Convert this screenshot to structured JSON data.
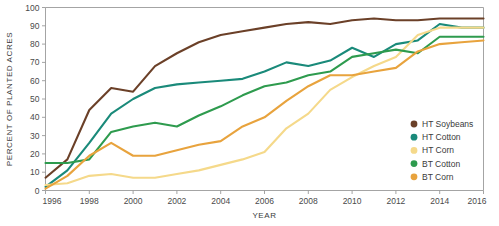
{
  "chart_data": {
    "type": "line",
    "title": "",
    "xlabel": "YEAR",
    "ylabel": "PERCENT OF PLANTED ACRES",
    "xlim": [
      1996,
      2016
    ],
    "ylim": [
      0,
      100
    ],
    "grid": false,
    "legend_position": "bottom-right",
    "x": [
      1996,
      1997,
      1998,
      1999,
      2000,
      2001,
      2002,
      2003,
      2004,
      2005,
      2006,
      2007,
      2008,
      2009,
      2010,
      2011,
      2012,
      2013,
      2014,
      2015,
      2016
    ],
    "xticks": [
      "1996",
      "1998",
      "2000",
      "2002",
      "2004",
      "2006",
      "2008",
      "2010",
      "2012",
      "2014",
      "2016"
    ],
    "yticks": [
      "0",
      "10",
      "20",
      "30",
      "40",
      "50",
      "60",
      "70",
      "80",
      "90",
      "100"
    ],
    "series": [
      {
        "name": "HT Soybeans",
        "color": "#6B4028",
        "values": [
          7,
          17,
          44,
          56,
          54,
          68,
          75,
          81,
          85,
          87,
          89,
          91,
          92,
          91,
          93,
          94,
          93,
          93,
          94,
          94,
          94
        ]
      },
      {
        "name": "HT Cotton",
        "color": "#1A8A7A",
        "values": [
          2,
          11,
          26,
          42,
          50,
          56,
          58,
          59,
          60,
          61,
          65,
          70,
          68,
          71,
          78,
          73,
          80,
          82,
          91,
          89,
          89
        ]
      },
      {
        "name": "HT Corn",
        "color": "#F5D98A",
        "values": [
          3,
          4,
          8,
          9,
          7,
          7,
          9,
          11,
          14,
          17,
          21,
          34,
          42,
          55,
          62,
          68,
          73,
          85,
          89,
          89,
          89
        ]
      },
      {
        "name": "BT Cotton",
        "color": "#2E9B4E",
        "values": [
          15,
          15,
          17,
          32,
          35,
          37,
          35,
          41,
          46,
          52,
          57,
          59,
          63,
          65,
          73,
          75,
          77,
          75,
          84,
          84,
          84
        ]
      },
      {
        "name": "BT Corn",
        "color": "#E8A33D",
        "values": [
          1,
          8,
          19,
          26,
          19,
          19,
          22,
          25,
          27,
          35,
          40,
          49,
          57,
          63,
          63,
          65,
          67,
          76,
          80,
          81,
          82
        ]
      }
    ]
  },
  "legend": {
    "items": [
      {
        "label": "HT Soybeans",
        "color": "#6B4028"
      },
      {
        "label": "HT Cotton",
        "color": "#1A8A7A"
      },
      {
        "label": "HT Corn",
        "color": "#F5D98A"
      },
      {
        "label": "BT Cotton",
        "color": "#2E9B4E"
      },
      {
        "label": "BT Corn",
        "color": "#E8A33D"
      }
    ]
  }
}
